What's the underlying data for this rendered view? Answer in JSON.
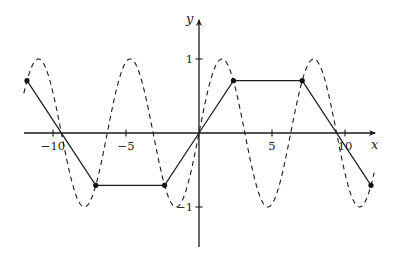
{
  "chart_data": {
    "type": "line",
    "title": "",
    "xlabel": "x",
    "ylabel": "y",
    "xlim": [
      -12,
      12
    ],
    "ylim": [
      -1.55,
      1.5
    ],
    "grid": false,
    "legend": null,
    "x_ticks": [
      -10,
      -5,
      5,
      10
    ],
    "x_tick_labels": [
      "−10",
      "−5",
      "5",
      "10"
    ],
    "y_ticks": [
      1,
      -1
    ],
    "y_tick_labels": [
      "1",
      "−1"
    ],
    "series": [
      {
        "name": "sin(x)",
        "style": "dashed",
        "function": "sin",
        "x_range": [
          -12,
          12
        ]
      },
      {
        "name": "piecewise linear",
        "style": "solid",
        "markers": true,
        "points": [
          [
            -11.78,
            0.707
          ],
          [
            -7.07,
            -0.707
          ],
          [
            -2.36,
            -0.707
          ],
          [
            0,
            0
          ],
          [
            2.36,
            0.707
          ],
          [
            7.07,
            0.707
          ],
          [
            11.78,
            -0.707
          ]
        ],
        "marker_points": [
          [
            -11.78,
            0.707
          ],
          [
            -7.07,
            -0.707
          ],
          [
            -2.36,
            -0.707
          ],
          [
            2.36,
            0.707
          ],
          [
            7.07,
            0.707
          ],
          [
            11.78,
            -0.707
          ]
        ]
      }
    ]
  },
  "layout": {
    "origin_px": [
      199,
      133
    ],
    "x_scale_px": 14.6,
    "y_scale_px": 74,
    "x_axis_px": [
      24,
      375
    ],
    "y_axis_px": [
      247,
      20
    ]
  }
}
